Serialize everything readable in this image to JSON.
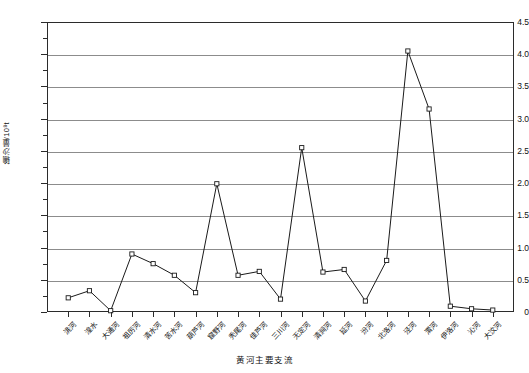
{
  "chart_data": {
    "type": "line",
    "title": "",
    "xlabel": "黄河主要支流",
    "ylabel": "输沙量/10⁸t",
    "ylim": [
      0,
      4.5
    ],
    "ytick_step": 0.5,
    "yminor_step": 0.25,
    "grid": "horizontal",
    "legend": "none",
    "marker": "open-square",
    "ytick_labels": [
      "0",
      "0.5",
      "1.0",
      "1.5",
      "2.0",
      "2.5",
      "3.0",
      "3.5",
      "4.0",
      "4.5"
    ],
    "ytick_values": [
      0,
      0.5,
      1.0,
      1.5,
      2.0,
      2.5,
      3.0,
      3.5,
      4.0,
      4.5
    ],
    "categories": [
      "洮河",
      "湟水",
      "大通河",
      "祖厉河",
      "清水河",
      "苦水河",
      "葫芦河",
      "窟野河",
      "秃尾河",
      "佳芦河",
      "三川河",
      "无定河",
      "清涧河",
      "延河",
      "汾河",
      "北洛河",
      "泾河",
      "渭河",
      "伊洛河",
      "沁河",
      "大汶河"
    ],
    "values": [
      0.22,
      0.33,
      0.02,
      0.9,
      0.75,
      0.57,
      0.3,
      1.99,
      0.57,
      0.63,
      0.2,
      2.55,
      0.62,
      0.66,
      0.17,
      0.8,
      4.05,
      3.15,
      0.09,
      0.05,
      0.03
    ],
    "series": [
      {
        "name": "输沙量",
        "values": [
          0.22,
          0.33,
          0.02,
          0.9,
          0.75,
          0.57,
          0.3,
          1.99,
          0.57,
          0.63,
          0.2,
          2.55,
          0.62,
          0.66,
          0.17,
          0.8,
          4.05,
          3.15,
          0.09,
          0.05,
          0.03
        ]
      }
    ],
    "colors": {
      "line": "#1a1a1a",
      "marker_fill": "#ffffff",
      "marker_stroke": "#1a1a1a",
      "gridline": "#8c8c8c",
      "axis": "#2b2b2b",
      "background": "#ffffff"
    }
  }
}
